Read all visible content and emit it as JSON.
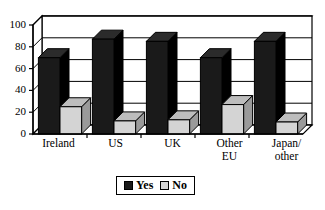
{
  "chart_data": {
    "type": "bar",
    "title": "",
    "subtitle": "",
    "xlabel": "",
    "ylabel": "",
    "ylim": [
      0,
      100
    ],
    "yticks": [
      0,
      20,
      40,
      60,
      80,
      100
    ],
    "grid": true,
    "style": "3d-column",
    "legend_position": "bottom",
    "categories": [
      "Ireland",
      "US",
      "UK",
      "Other EU",
      "Japan/other"
    ],
    "category_lines": [
      [
        "Ireland"
      ],
      [
        "US"
      ],
      [
        "UK"
      ],
      [
        "Other",
        "EU"
      ],
      [
        "Japan/",
        "other"
      ]
    ],
    "series": [
      {
        "name": "Yes",
        "color": "#1a1a1a",
        "values": [
          70,
          87,
          85,
          70,
          85
        ]
      },
      {
        "name": "No",
        "color": "#d4d4d4",
        "values": [
          25,
          12,
          13,
          27,
          11
        ]
      }
    ]
  },
  "legend": {
    "items": [
      {
        "label": "Yes",
        "swatch": "black-square-icon"
      },
      {
        "label": "No",
        "swatch": "gray-square-icon"
      }
    ]
  },
  "axis": {
    "y_tick_labels": [
      "100",
      "80",
      "60",
      "40",
      "20",
      "0"
    ]
  }
}
